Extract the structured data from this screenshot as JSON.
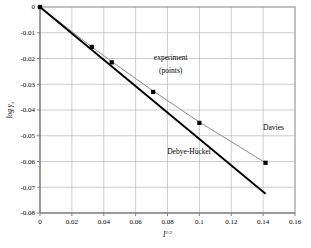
{
  "chart_data": {
    "type": "scatter",
    "title": "",
    "xlabel": "I",
    "xlabel_exponent": "1/2",
    "ylabel": "log γ",
    "ylabel_subscript": "±",
    "xlim": [
      0,
      0.16
    ],
    "ylim": [
      -0.08,
      0
    ],
    "grid": true,
    "legend_position": "inline-annotations",
    "xticks": [
      "0",
      "0.02",
      "0.04",
      "0.06",
      "0.08",
      "0.1",
      "0.12",
      "0.14",
      "0.16"
    ],
    "xtick_values": [
      0,
      0.02,
      0.04,
      0.06,
      0.08,
      0.1,
      0.12,
      0.14,
      0.16
    ],
    "yticks": [
      "0",
      "-0.01",
      "-0.02",
      "-0.03",
      "-0.04",
      "-0.05",
      "-0.06",
      "-0.07",
      "-0.08"
    ],
    "ytick_values": [
      0,
      -0.01,
      -0.02,
      -0.03,
      -0.04,
      -0.05,
      -0.06,
      -0.07,
      -0.08
    ],
    "series": [
      {
        "name": "experiment (points)",
        "render": "points",
        "color": "#000000",
        "marker": "square",
        "x": [
          0.0,
          0.0325,
          0.045,
          0.071,
          0.1,
          0.1415
        ],
        "y": [
          0.0,
          -0.0155,
          -0.0215,
          -0.033,
          -0.045,
          -0.0605
        ]
      },
      {
        "name": "Davies",
        "render": "line",
        "color": "#8c8c8c",
        "x": [
          0.0,
          0.0325,
          0.045,
          0.071,
          0.1,
          0.1415
        ],
        "y": [
          0.0,
          -0.0155,
          -0.0212,
          -0.0326,
          -0.0447,
          -0.0605
        ]
      },
      {
        "name": "Debye-Hückel",
        "render": "line",
        "color": "#000000",
        "x": [
          0.0,
          0.1415
        ],
        "y": [
          0.0,
          -0.0725
        ]
      }
    ],
    "annotations": [
      {
        "text": "experiment",
        "x": 0.082,
        "y": -0.0205,
        "name": "experiment-annotation-line1"
      },
      {
        "text": "(points)",
        "x": 0.082,
        "y": -0.0255,
        "name": "experiment-annotation-line2"
      },
      {
        "text": "Davies",
        "x": 0.1465,
        "y": -0.0477,
        "name": "davies-annotation"
      },
      {
        "text": "Debye-Hückel",
        "x": 0.0935,
        "y": -0.057,
        "name": "debye-huckel-annotation"
      }
    ]
  }
}
